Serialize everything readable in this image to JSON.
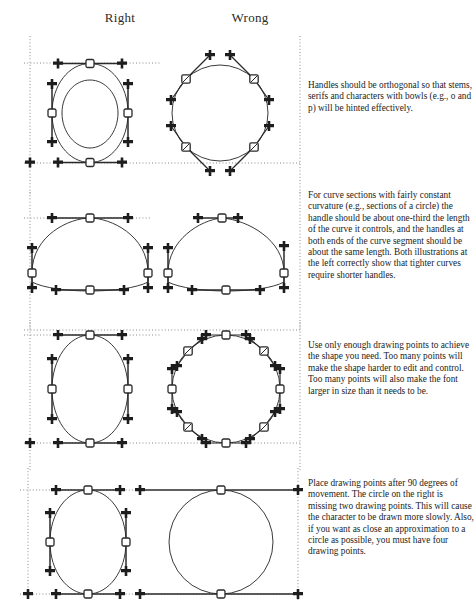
{
  "figure": {
    "kind": "instructional-typography-diagram",
    "title_columns": {
      "right": "Right",
      "wrong": "Wrong"
    },
    "colors": {
      "ink": "#1a1a1a",
      "curve": "#3a3a3a",
      "handle": "#2a2a2a",
      "guide": "#8a8a8a",
      "page": "#ffffff"
    }
  },
  "notes": {
    "row1": "Handles should be orthogonal so that stems, serifs and characters with bowls (e.g., o and p) will be hinted effectively.",
    "row2": "For curve sections with fairly constant curvature (e.g., sections of a circle) the handle should be about one-third the length of the curve it controls, and the handles at both ends of the curve segment should be about the same length. Both illustrations at the left correctly show that tighter curves require shorter handles.",
    "row3": "Use only enough drawing points to achieve the shape you need. Too many points will make the shape harder to edit and control. Too many points will also make the font larger in size than it needs to be.",
    "row4": "Place drawing points after 90 degrees of movement. The circle on the right is missing two drawing points. This will cause the character to be drawn more slowly. Also, if you want as close an approximation to a circle as possible, you must have four drawing points."
  },
  "rows": [
    {
      "id": "row-1",
      "left": {
        "label": "Right",
        "shape": "circle",
        "drawing_points": 4,
        "point_positions": [
          "top",
          "right",
          "bottom",
          "left"
        ],
        "handles": "orthogonal",
        "handle_count": 8
      },
      "right": {
        "label": "Wrong",
        "shape": "circle",
        "drawing_points": 4,
        "point_positions": [
          "upper-left-45",
          "upper-right-45",
          "lower-right-45",
          "lower-left-45"
        ],
        "handles": "non-orthogonal-diagonal",
        "handle_count": 8
      }
    },
    {
      "id": "row-2",
      "left": {
        "label": "Right",
        "shape": "arch",
        "drawing_points": 5,
        "handles": "orthogonal-one-third-length",
        "handle_note": "tighter curves use shorter handles"
      },
      "right": {
        "label": "Wrong",
        "shape": "arch",
        "drawing_points": 5,
        "handles": "orthogonal-uneven-length",
        "handle_note": "top handles too short for the curve length"
      }
    },
    {
      "id": "row-3",
      "left": {
        "label": "Right",
        "shape": "circle",
        "drawing_points": 4,
        "handles": "orthogonal",
        "handle_count": 8
      },
      "right": {
        "label": "Wrong",
        "shape": "circle",
        "drawing_points": 8,
        "handles": "orthogonal-and-diagonal",
        "handle_count": 16,
        "handle_note": "too many drawing points"
      }
    },
    {
      "id": "row-4",
      "left": {
        "label": "Right",
        "shape": "circle",
        "drawing_points": 4,
        "handles": "orthogonal",
        "handle_count": 8
      },
      "right": {
        "label": "Wrong",
        "shape": "circle",
        "drawing_points": 2,
        "point_positions": [
          "top",
          "bottom"
        ],
        "handles": "very-long-horizontal",
        "handle_count": 4,
        "handle_note": "missing two drawing points"
      }
    }
  ]
}
